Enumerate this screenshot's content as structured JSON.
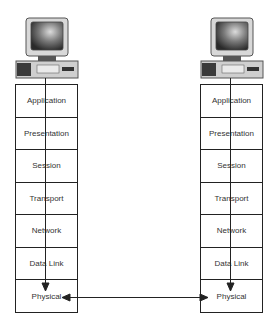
{
  "diagram": {
    "type": "osi-model-communication",
    "hosts": [
      {
        "name": "left-host",
        "layers": [
          "Application",
          "Presentation",
          "Session",
          "Transport",
          "Network",
          "Data Link",
          "Physical"
        ]
      },
      {
        "name": "right-host",
        "layers": [
          "Application",
          "Presentation",
          "Session",
          "Transport",
          "Network",
          "Data Link",
          "Physical"
        ]
      }
    ],
    "connections": [
      {
        "from": "left-host.Application",
        "to": "left-host.Physical",
        "direction": "down"
      },
      {
        "from": "right-host.Application",
        "to": "right-host.Physical",
        "direction": "down"
      },
      {
        "from": "left-host.Physical",
        "to": "right-host.Physical",
        "direction": "bidirectional"
      }
    ],
    "colors": {
      "line": "#222222",
      "text": "#333333",
      "background": "#ffffff"
    }
  }
}
